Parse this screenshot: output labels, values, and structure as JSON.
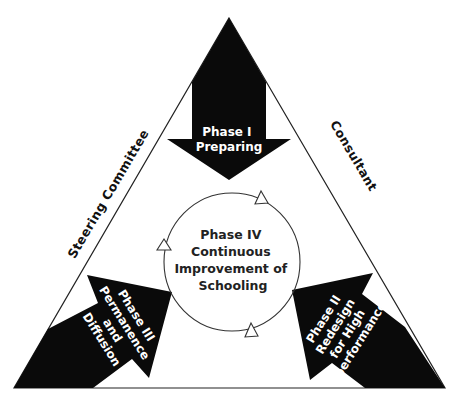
{
  "diagram": {
    "title": "",
    "colors": {
      "background": "#ffffff",
      "arrow_fill": "#0a0a0a",
      "line": "#222222",
      "arrow_text": "#ffffff",
      "center_text": "#222222"
    },
    "triangle_sides": {
      "left": "Steering Committee",
      "right": "Consultant",
      "bottom": ""
    },
    "phases": [
      {
        "id": "phase-1",
        "position": "top",
        "direction": "down",
        "lines": [
          "Phase I",
          "Preparing"
        ]
      },
      {
        "id": "phase-2",
        "position": "bottom-right",
        "direction": "up-left",
        "lines": [
          "Phase II",
          "Redesign",
          "for High",
          "performance"
        ]
      },
      {
        "id": "phase-3",
        "position": "bottom-left",
        "direction": "up-right",
        "lines": [
          "Phase III",
          "Permanence",
          "and",
          "Diffusion"
        ]
      },
      {
        "id": "phase-4",
        "position": "center",
        "shape": "cycle",
        "lines": [
          "Phase IV",
          "Continuous",
          "Improvement of",
          "Schooling"
        ]
      }
    ]
  }
}
